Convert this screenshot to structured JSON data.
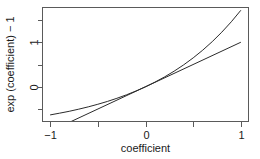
{
  "chart_data": {
    "type": "line",
    "title": "",
    "xlabel": "coefficient",
    "ylabel": "exp (coefficient) − 1",
    "xlim": [
      -1.08,
      1.08
    ],
    "ylim": [
      -0.78,
      1.78
    ],
    "grid": false,
    "legend": null,
    "x_ticks": [
      {
        "value": -1,
        "label": "−1"
      },
      {
        "value": -0.5,
        "label": ""
      },
      {
        "value": 0,
        "label": "0"
      },
      {
        "value": 0.5,
        "label": ""
      },
      {
        "value": 1,
        "label": "1"
      }
    ],
    "y_ticks": [
      {
        "value": 1.5,
        "label": ""
      },
      {
        "value": 1,
        "label": "1"
      },
      {
        "value": 0.5,
        "label": ""
      },
      {
        "value": 0,
        "label": "0"
      },
      {
        "value": -0.5,
        "label": ""
      }
    ],
    "series": [
      {
        "name": "exp(coefficient) - 1",
        "shape": "exponential",
        "x": [
          -1,
          -0.9,
          -0.8,
          -0.7,
          -0.6,
          -0.5,
          -0.4,
          -0.3,
          -0.2,
          -0.1,
          0,
          0.1,
          0.2,
          0.3,
          0.4,
          0.5,
          0.6,
          0.7,
          0.8,
          0.9,
          1
        ],
        "values": [
          -0.632,
          -0.593,
          -0.551,
          -0.503,
          -0.451,
          -0.393,
          -0.33,
          -0.259,
          -0.181,
          -0.095,
          0,
          0.105,
          0.221,
          0.35,
          0.492,
          0.649,
          0.822,
          1.014,
          1.226,
          1.46,
          1.718
        ],
        "color": "#2b2b2b"
      },
      {
        "name": "coefficient (identity)",
        "shape": "linear",
        "x": [
          -0.78,
          1
        ],
        "values": [
          -0.78,
          1
        ],
        "color": "#2b2b2b"
      }
    ]
  },
  "axes": {
    "x_title": "coefficient",
    "y_title": "exp (coefficient) − 1",
    "x_tick_labels": [
      "−1",
      "0",
      "1"
    ],
    "y_tick_labels": [
      "1",
      "0"
    ]
  },
  "colors": {
    "background": "#ffffff",
    "axis": "#5a5a5a",
    "curve": "#2b2b2b",
    "text": "#1a1a1a"
  }
}
